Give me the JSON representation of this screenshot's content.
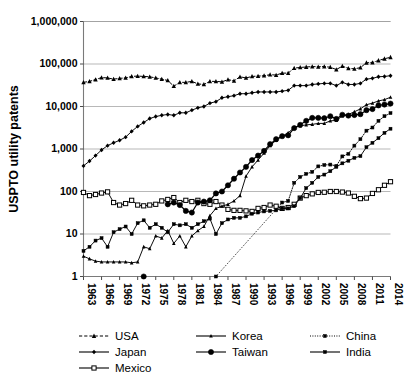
{
  "chart_data": {
    "type": "line",
    "title": "",
    "xlabel": "",
    "ylabel": "USPTO utility patents",
    "yscale": "log",
    "ylim": [
      1,
      1000000
    ],
    "ytick_labels": [
      "1",
      "10",
      "100",
      "1,000",
      "10,000",
      "100,000",
      "1,000,000"
    ],
    "ytick_values": [
      1,
      10,
      100,
      1000,
      10000,
      100000,
      1000000
    ],
    "xlim": [
      1963,
      2014
    ],
    "xtick_labels": [
      "1963",
      "1966",
      "1969",
      "1972",
      "1975",
      "1978",
      "1981",
      "1984",
      "1987",
      "1990",
      "1993",
      "1996",
      "1999",
      "2002",
      "2005",
      "2008",
      "2011",
      "2014"
    ],
    "xtick_values": [
      1963,
      1966,
      1969,
      1972,
      1975,
      1978,
      1981,
      1984,
      1987,
      1990,
      1993,
      1996,
      1999,
      2002,
      2005,
      2008,
      2011,
      2014
    ],
    "grid": true,
    "legend_position": "bottom",
    "x": [
      1963,
      1964,
      1965,
      1966,
      1967,
      1968,
      1969,
      1970,
      1971,
      1972,
      1973,
      1974,
      1975,
      1976,
      1977,
      1978,
      1979,
      1980,
      1981,
      1982,
      1983,
      1984,
      1985,
      1986,
      1987,
      1988,
      1989,
      1990,
      1991,
      1992,
      1993,
      1994,
      1995,
      1996,
      1997,
      1998,
      1999,
      2000,
      2001,
      2002,
      2003,
      2004,
      2005,
      2006,
      2007,
      2008,
      2009,
      2010,
      2011,
      2012,
      2013,
      2014
    ],
    "series": [
      {
        "name": "USA",
        "marker": "triangle",
        "linestyle": "dashed",
        "values": [
          37000,
          39000,
          43000,
          48000,
          47000,
          44000,
          46000,
          47000,
          51000,
          52000,
          51000,
          50000,
          47000,
          44000,
          41000,
          30000,
          37000,
          37000,
          39000,
          34000,
          33000,
          39000,
          39000,
          38000,
          43000,
          40000,
          50000,
          47000,
          51000,
          52000,
          53000,
          56000,
          55000,
          61000,
          61000,
          80000,
          83000,
          85000,
          87000,
          86000,
          87000,
          84000,
          74000,
          89000,
          79000,
          77000,
          82000,
          107000,
          108000,
          121000,
          133000,
          144000
        ]
      },
      {
        "name": "Japan",
        "marker": "diamond",
        "linestyle": "solid",
        "values": [
          400,
          520,
          700,
          950,
          1200,
          1400,
          1600,
          1900,
          2600,
          3400,
          4200,
          5200,
          5800,
          6200,
          6500,
          6200,
          7100,
          7100,
          8200,
          9300,
          10000,
          12000,
          13000,
          16000,
          17000,
          18000,
          20000,
          20000,
          21000,
          22000,
          22000,
          22000,
          22000,
          23000,
          24000,
          31000,
          31000,
          31000,
          33000,
          34000,
          35000,
          35000,
          31000,
          37000,
          33000,
          33000,
          35000,
          44000,
          46000,
          50000,
          51000,
          53000
        ]
      },
      {
        "name": "Mexico",
        "marker": "open-square",
        "linestyle": "solid",
        "values": [
          95,
          80,
          85,
          92,
          98,
          55,
          48,
          52,
          62,
          48,
          46,
          48,
          50,
          60,
          65,
          72,
          55,
          62,
          58,
          62,
          52,
          50,
          58,
          48,
          38,
          36,
          36,
          35,
          34,
          40,
          42,
          48,
          45,
          40,
          42,
          50,
          70,
          80,
          88,
          95,
          96,
          100,
          100,
          97,
          92,
          77,
          68,
          70,
          90,
          110,
          140,
          170
        ]
      },
      {
        "name": "Korea",
        "marker": "small-triangle",
        "linestyle": "solid",
        "values": [
          3,
          2.6,
          2.3,
          2.2,
          2.2,
          2.2,
          2.2,
          2.2,
          2.1,
          2.2,
          5,
          4.5,
          9,
          8,
          12,
          6,
          9,
          5,
          9,
          12,
          15,
          27,
          40,
          45,
          50,
          60,
          80,
          230,
          380,
          550,
          800,
          1200,
          1600,
          2000,
          2400,
          3200,
          3500,
          3700,
          3800,
          4000,
          4000,
          4600,
          4700,
          6000,
          6500,
          7500,
          8800,
          11000,
          12000,
          13500,
          14500,
          16500
        ]
      },
      {
        "name": "Taiwan",
        "marker": "filled-circle",
        "linestyle": "solid",
        "values": [
          null,
          null,
          null,
          null,
          null,
          null,
          null,
          null,
          null,
          null,
          1,
          null,
          null,
          null,
          50,
          55,
          48,
          35,
          32,
          55,
          58,
          62,
          90,
          100,
          140,
          200,
          280,
          380,
          550,
          700,
          900,
          1300,
          1700,
          2000,
          2100,
          3100,
          3700,
          4600,
          5400,
          5400,
          5300,
          5900,
          5100,
          6400,
          6100,
          6300,
          6600,
          8200,
          8700,
          10600,
          11100,
          11700
        ]
      },
      {
        "name": "China",
        "marker": "small-square",
        "linestyle": "dotted",
        "values": [
          null,
          null,
          null,
          null,
          null,
          null,
          null,
          null,
          null,
          null,
          null,
          null,
          null,
          null,
          null,
          null,
          null,
          null,
          null,
          null,
          null,
          null,
          1,
          null,
          null,
          null,
          null,
          null,
          null,
          null,
          null,
          null,
          null,
          55,
          60,
          160,
          220,
          260,
          290,
          390,
          420,
          430,
          400,
          670,
          770,
          1200,
          1700,
          2700,
          3200,
          4600,
          5900,
          7000
        ]
      },
      {
        "name": "India",
        "marker": "small-square",
        "linestyle": "solid",
        "values": [
          4,
          5,
          7,
          8,
          5,
          11,
          13,
          15,
          10,
          18,
          21,
          14,
          17,
          14,
          11,
          17,
          16,
          17,
          14,
          17,
          20,
          23,
          10,
          18,
          22,
          24,
          24,
          26,
          30,
          32,
          34,
          35,
          36,
          40,
          40,
          45,
          70,
          120,
          160,
          220,
          250,
          300,
          380,
          460,
          530,
          620,
          680,
          1100,
          1400,
          1800,
          2400,
          3000
        ]
      }
    ]
  },
  "legend": {
    "entries": [
      {
        "label": "USA",
        "marker": "triangle",
        "linestyle": "dashed"
      },
      {
        "label": "Japan",
        "marker": "diamond",
        "linestyle": "solid"
      },
      {
        "label": "Mexico",
        "marker": "open-square",
        "linestyle": "solid"
      },
      {
        "label": "Korea",
        "marker": "small-triangle",
        "linestyle": "solid"
      },
      {
        "label": "Taiwan",
        "marker": "filled-circle",
        "linestyle": "solid"
      },
      {
        "label": "China",
        "marker": "small-square",
        "linestyle": "dotted"
      },
      {
        "label": "India",
        "marker": "small-square",
        "linestyle": "solid"
      }
    ]
  },
  "colors": {
    "ink": "#000000",
    "grid": "#9a9a9a",
    "axis": "#7a7a7a",
    "background": "#ffffff"
  }
}
